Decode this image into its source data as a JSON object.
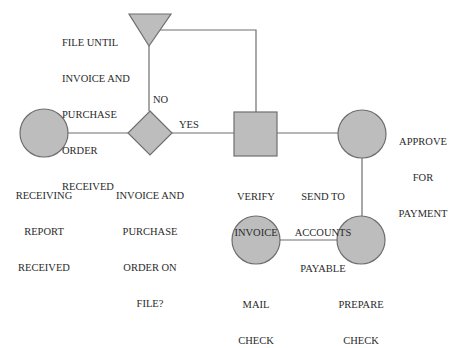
{
  "colors": {
    "shape_fill": "#bdbdbd",
    "shape_stroke": "#6e6e6e",
    "connector": "#6e6e6e",
    "text": "#2a2a2a"
  },
  "nodes": {
    "file_until": {
      "shape": "triangle-down",
      "label": [
        "FILE UNTIL",
        "INVOICE AND",
        "PURCHASE",
        "ORDER",
        "RECEIVED"
      ]
    },
    "receiving_report": {
      "shape": "circle",
      "label": [
        "RECEIVING",
        "REPORT",
        "RECEIVED"
      ]
    },
    "decision": {
      "shape": "diamond",
      "label": [
        "INVOICE AND",
        "PURCHASE",
        "ORDER ON",
        "FILE?"
      ]
    },
    "verify_invoice": {
      "shape": "square",
      "label": [
        "VERIFY",
        "INVOICE"
      ]
    },
    "approve_payment": {
      "shape": "circle",
      "label": [
        "APPROVE",
        "FOR",
        "PAYMENT"
      ]
    },
    "send_to_ap": {
      "shape": "edge-label",
      "label": [
        "SEND TO",
        "ACCOUNTS",
        "PAYABLE"
      ]
    },
    "prepare_check": {
      "shape": "circle",
      "label": [
        "PREPARE",
        "CHECK"
      ]
    },
    "mail_check": {
      "shape": "circle",
      "label": [
        "MAIL",
        "CHECK"
      ]
    }
  },
  "edges": {
    "no_label": "NO",
    "yes_label": "YES"
  }
}
